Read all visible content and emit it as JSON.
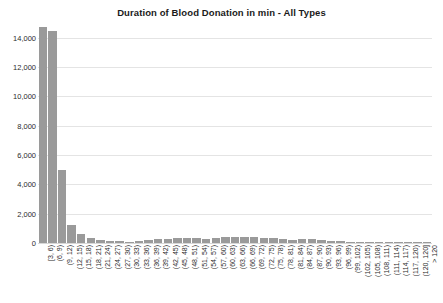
{
  "chart_data": {
    "type": "bar",
    "title": "Duration of Blood Donation in min - All Types",
    "xlabel": "",
    "ylabel": "",
    "ylim": [
      0,
      15200
    ],
    "grid": true,
    "legend": "none",
    "yticks": [
      0,
      2000,
      4000,
      6000,
      8000,
      10000,
      12000,
      14000
    ],
    "ytick_labels": [
      "0",
      "2,000",
      "4,000",
      "6,000",
      "8,000",
      "10,000",
      "12,000",
      "14,000"
    ],
    "categories": [
      "[3, 6)",
      "(6, 9)",
      "(9, 12)",
      "(12, 15)",
      "(15, 18)",
      "(18, 21)",
      "(21, 24)",
      "(24, 27)",
      "(27, 30)",
      "(30, 33)",
      "(33, 36)",
      "(36, 39)",
      "(39, 42)",
      "(42, 45)",
      "(45, 48)",
      "(48, 51)",
      "(51, 54)",
      "(54, 57)",
      "(57, 60)",
      "(60, 63)",
      "(63, 66)",
      "(66, 69)",
      "(69, 72)",
      "(72, 75)",
      "(75, 78)",
      "(78, 81)",
      "(81, 84)",
      "(84, 87)",
      "(87, 90)",
      "(90, 93)",
      "(93, 96)",
      "(96, 99)",
      "(99, 102)",
      "(102, 105)",
      "(105, 108)",
      "(108, 111)",
      "(111, 114)",
      "(114, 117)",
      "(117, 120)",
      "(120, 120]",
      "> 120"
    ],
    "values": [
      14700,
      14450,
      4950,
      1200,
      620,
      330,
      210,
      150,
      110,
      95,
      130,
      190,
      240,
      290,
      330,
      360,
      330,
      300,
      350,
      400,
      390,
      380,
      400,
      370,
      330,
      260,
      230,
      300,
      270,
      180,
      140,
      110,
      90,
      70,
      55,
      45,
      35,
      30,
      25,
      20,
      60
    ]
  },
  "colors": {
    "bar": "#9a9a9a",
    "gridline": "#e4e4e4",
    "text": "#2b2b2b",
    "title": "#1a1a1a",
    "background": "#ffffff"
  }
}
